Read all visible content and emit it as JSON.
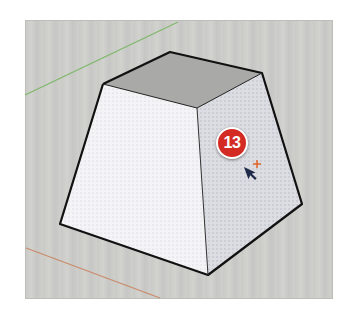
{
  "viewport": {
    "background": "#cbcbc8",
    "axes": {
      "green": {
        "color": "#7fb86a",
        "from": [
          25,
          95
        ],
        "to": [
          178,
          22
        ]
      },
      "red": {
        "color": "#c98c6a",
        "from": [
          26,
          248
        ],
        "to": [
          160,
          298
        ]
      }
    },
    "model": {
      "shape": "frustum",
      "top_face_color": "#a9a9a7",
      "front_face_color": "#f4f4f6",
      "right_face_color": "#dcdde2",
      "edge_color": "#111111"
    }
  },
  "step_badge": {
    "number": "13",
    "color": "#d42a24"
  },
  "cursor": {
    "type": "select-arrow",
    "inference_marker": "+",
    "marker_color": "#e0622a"
  }
}
